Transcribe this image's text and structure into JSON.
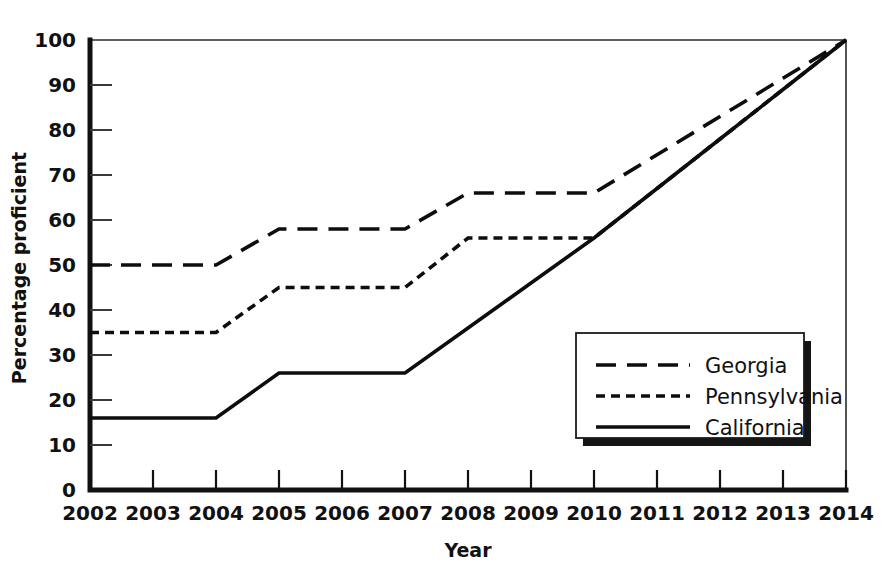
{
  "chart_data": {
    "type": "line",
    "title": "",
    "xlabel": "Year",
    "ylabel": "Percentage proficient",
    "x": [
      2002,
      2003,
      2004,
      2005,
      2006,
      2007,
      2008,
      2009,
      2010,
      2011,
      2012,
      2013,
      2014
    ],
    "xtick_labels": [
      "2002",
      "2003",
      "2004",
      "2005",
      "2006",
      "2007",
      "2008",
      "2009",
      "2010",
      "2011",
      "2012",
      "2013",
      "2014"
    ],
    "ytick_labels": [
      "0",
      "10",
      "20",
      "30",
      "40",
      "50",
      "60",
      "70",
      "80",
      "90",
      "100"
    ],
    "yticks": [
      0,
      10,
      20,
      30,
      40,
      50,
      60,
      70,
      80,
      90,
      100
    ],
    "xlim": [
      2002,
      2014
    ],
    "ylim": [
      0,
      100
    ],
    "grid": false,
    "legend_position": "lower right",
    "series": [
      {
        "name": "Georgia",
        "style": "long-dash",
        "dasharray": "20 11",
        "color": "#0d0d0d",
        "values": [
          50,
          50,
          50,
          58,
          58,
          58,
          66,
          66,
          66,
          74.5,
          83,
          91.5,
          100
        ]
      },
      {
        "name": "Pennsylvania",
        "style": "short-dash",
        "dasharray": "9 6",
        "color": "#0d0d0d",
        "values": [
          35,
          35,
          35,
          45,
          45,
          45,
          56,
          56,
          56,
          67,
          78,
          89,
          100
        ]
      },
      {
        "name": "California",
        "style": "solid",
        "dasharray": "none",
        "color": "#0d0d0d",
        "values": [
          16,
          16,
          16,
          26,
          26,
          26,
          36,
          46,
          56,
          67,
          78,
          89,
          100
        ]
      }
    ]
  },
  "legend": {
    "entries": [
      {
        "label": "Georgia"
      },
      {
        "label": "Pennsylvania"
      },
      {
        "label": "California"
      }
    ]
  }
}
